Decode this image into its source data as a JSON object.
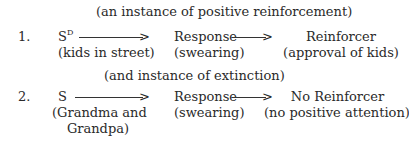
{
  "section1": {
    "caption": "(an instance of positive reinforcement)",
    "number": "1.",
    "stimulus": "S",
    "stimulus_sup": "D",
    "stimulus_desc": "(kids in street)",
    "response": "Response",
    "response_desc": "(swearing)",
    "consequence": "Reinforcer",
    "consequence_desc": "(approval of kids)"
  },
  "section2": {
    "caption": "(and instance of extinction)",
    "number": "2.",
    "stimulus": "S",
    "stimulus_desc_line1": "(Grandma and",
    "stimulus_desc_line2": "Grandpa)",
    "response": "Response",
    "response_desc": "(swearing)",
    "consequence": "No Reinforcer",
    "consequence_desc": "(no positive attention)"
  },
  "arrow_glyph": ">"
}
